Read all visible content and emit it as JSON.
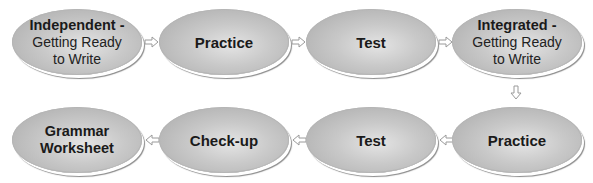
{
  "diagram": {
    "rows": [
      {
        "direction": "left-to-right",
        "nodes": [
          {
            "title": "Independent -",
            "sub_lines": [
              "Getting Ready",
              "to Write"
            ]
          },
          {
            "title": "Practice",
            "sub_lines": []
          },
          {
            "title": "Test",
            "sub_lines": []
          },
          {
            "title": "Integrated -",
            "sub_lines": [
              "Getting Ready",
              "to Write"
            ]
          }
        ]
      },
      {
        "direction": "right-to-left",
        "nodes": [
          {
            "title": "Grammar",
            "title2": "Worksheet",
            "sub_lines": []
          },
          {
            "title": "Check-up",
            "sub_lines": []
          },
          {
            "title": "Test",
            "sub_lines": []
          },
          {
            "title": "Practice",
            "sub_lines": []
          }
        ]
      }
    ],
    "arrows": [
      {
        "from": "Independent - Getting Ready to Write",
        "to": "Practice",
        "icon": "arrow-right-icon"
      },
      {
        "from": "Practice",
        "to": "Test",
        "icon": "arrow-right-icon"
      },
      {
        "from": "Test",
        "to": "Integrated - Getting Ready to Write",
        "icon": "arrow-right-icon"
      },
      {
        "from": "Integrated - Getting Ready to Write",
        "to": "Practice",
        "icon": "arrow-down-icon"
      },
      {
        "from": "Practice",
        "to": "Test",
        "icon": "arrow-left-icon"
      },
      {
        "from": "Test",
        "to": "Check-up",
        "icon": "arrow-left-icon"
      },
      {
        "from": "Check-up",
        "to": "Grammar Worksheet",
        "icon": "arrow-left-icon"
      }
    ],
    "colors": {
      "node_fill_light": "#e4e4e4",
      "node_fill_dark": "#a8a8a8",
      "text": "#1a1a1a",
      "arrow_stroke": "#9a9a9a"
    }
  }
}
